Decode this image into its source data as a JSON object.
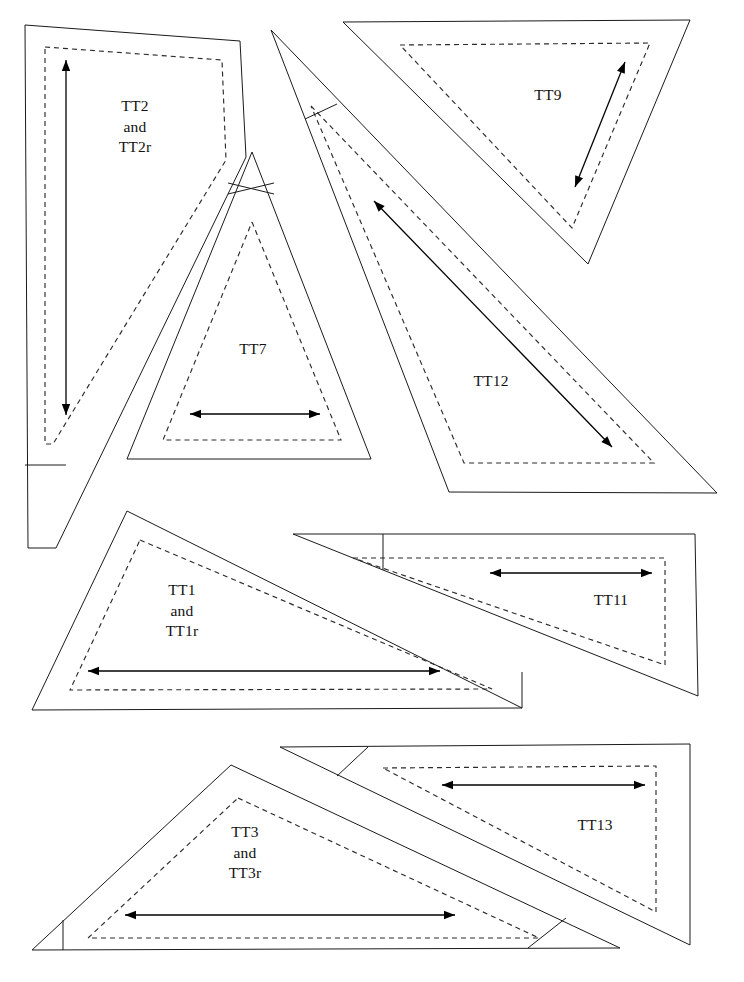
{
  "document": {
    "kind": "quilt-template-pattern-sheet",
    "page_width": 744,
    "page_height": 982,
    "background_color": "#ffffff",
    "line_color": "#1a1a1a",
    "dash_color": "#2b2b2b",
    "arrow_color": "#000000"
  },
  "pieces": [
    {
      "id": "TT2",
      "label": "TT2\nand\nTT2r",
      "label_x": 99,
      "label_y": 96,
      "label_width": 72,
      "cut_outline": "25,25 240,41 246,157 56,548 28,548 25,25",
      "seam_outline": "45,47 222,60 226,160 53,444 45,444 45,47",
      "notch": "M 25,465 L 66,465",
      "arrow": {
        "x1": 66,
        "y1": 415,
        "x2": 66,
        "y2": 60,
        "double": true
      }
    },
    {
      "id": "TT7",
      "label": "TT7",
      "label_x": 227,
      "label_y": 339,
      "label_width": 52,
      "cut_outline": "252,152 371,459 127,459 252,152",
      "seam_outline": "252,222 341,440 163,440 252,222",
      "notch": "M 228,183 L 274,194 M 228,194 L 274,183",
      "arrow": {
        "x1": 190,
        "y1": 414,
        "x2": 320,
        "y2": 414,
        "double": true
      }
    },
    {
      "id": "TT9",
      "label": "TT9",
      "label_x": 522,
      "label_y": 85,
      "label_width": 52,
      "cut_outline": "343,22 690,20 588,264 343,22",
      "seam_outline": "400,45 650,43 572,228 400,45",
      "notch": "",
      "arrow": {
        "x1": 575,
        "y1": 187,
        "x2": 625,
        "y2": 62,
        "double": true
      }
    },
    {
      "id": "TT12",
      "label": "TT12",
      "label_x": 460,
      "label_y": 371,
      "label_width": 62,
      "cut_outline": "271,30 717,493 449,492 271,30",
      "seam_outline": "311,106 654,463 464,463 311,106",
      "notch": "M 337,104 L 305,119",
      "arrow": {
        "x1": 374,
        "y1": 201,
        "x2": 612,
        "y2": 447,
        "double": true
      }
    },
    {
      "id": "TT1",
      "label": "TT1\nand\nTT1r",
      "label_x": 146,
      "label_y": 580,
      "label_width": 72,
      "cut_outline": "127,511 522,708 32,710 127,511",
      "seam_outline": "140,540 492,689 70,690 140,540",
      "notch": "M 522,672 L 522,708",
      "arrow": {
        "x1": 88,
        "y1": 671,
        "x2": 440,
        "y2": 671,
        "double": true
      }
    },
    {
      "id": "TT11",
      "label": "TT11",
      "label_x": 580,
      "label_y": 590,
      "label_width": 62,
      "cut_outline": "293,534 695,534 698,696 293,534",
      "seam_outline": "353,558 665,558 665,665 353,558",
      "notch": "M 383,534 L 383,570",
      "arrow": {
        "x1": 490,
        "y1": 573,
        "x2": 652,
        "y2": 573,
        "double": true
      }
    },
    {
      "id": "TT3",
      "label": "TT3\nand\nTT3r",
      "label_x": 209,
      "label_y": 822,
      "label_width": 72,
      "cut_outline": "231,765 620,948 32,950 231,765",
      "seam_outline": "238,798 539,938 88,938 238,798",
      "notch": "M 63,920 L 63,950 M 566,918 L 528,948",
      "arrow": {
        "x1": 125,
        "y1": 915,
        "x2": 455,
        "y2": 915,
        "double": true
      }
    },
    {
      "id": "TT13",
      "label": "TT13",
      "label_x": 564,
      "label_y": 815,
      "label_width": 62,
      "cut_outline": "280,747 690,744 690,945 280,747",
      "seam_outline": "383,768 656,766 656,912 383,768",
      "notch": "M 368,747 L 337,776",
      "arrow": {
        "x1": 442,
        "y1": 785,
        "x2": 645,
        "y2": 785,
        "double": true
      }
    }
  ]
}
